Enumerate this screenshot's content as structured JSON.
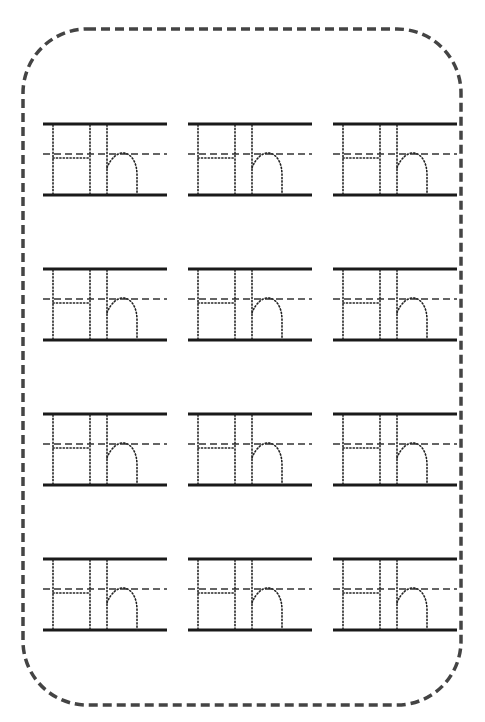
{
  "worksheet": {
    "title": "Letter Hh tracing practice",
    "letter_upper": "H",
    "letter_lower": "h",
    "border_style": "dashed-rounded",
    "colors": {
      "border": "#444444",
      "solid_line": "#1a1a1a",
      "dashed_line": "#333333",
      "trace_dots": "#222222",
      "background": "#ffffff"
    },
    "grid": {
      "rows": 4,
      "columns": 3,
      "row_tops": [
        124,
        269,
        414,
        559
      ],
      "column_lefts": [
        43,
        188,
        333
      ]
    },
    "blocks": [
      {
        "row": 1,
        "col": 1,
        "text": "Hh"
      },
      {
        "row": 1,
        "col": 2,
        "text": "Hh"
      },
      {
        "row": 1,
        "col": 3,
        "text": "Hh"
      },
      {
        "row": 2,
        "col": 1,
        "text": "Hh"
      },
      {
        "row": 2,
        "col": 2,
        "text": "Hh"
      },
      {
        "row": 2,
        "col": 3,
        "text": "Hh"
      },
      {
        "row": 3,
        "col": 1,
        "text": "Hh"
      },
      {
        "row": 3,
        "col": 2,
        "text": "Hh"
      },
      {
        "row": 3,
        "col": 3,
        "text": "Hh"
      },
      {
        "row": 4,
        "col": 1,
        "text": "Hh"
      },
      {
        "row": 4,
        "col": 2,
        "text": "Hh"
      },
      {
        "row": 4,
        "col": 3,
        "text": "Hh"
      }
    ]
  }
}
